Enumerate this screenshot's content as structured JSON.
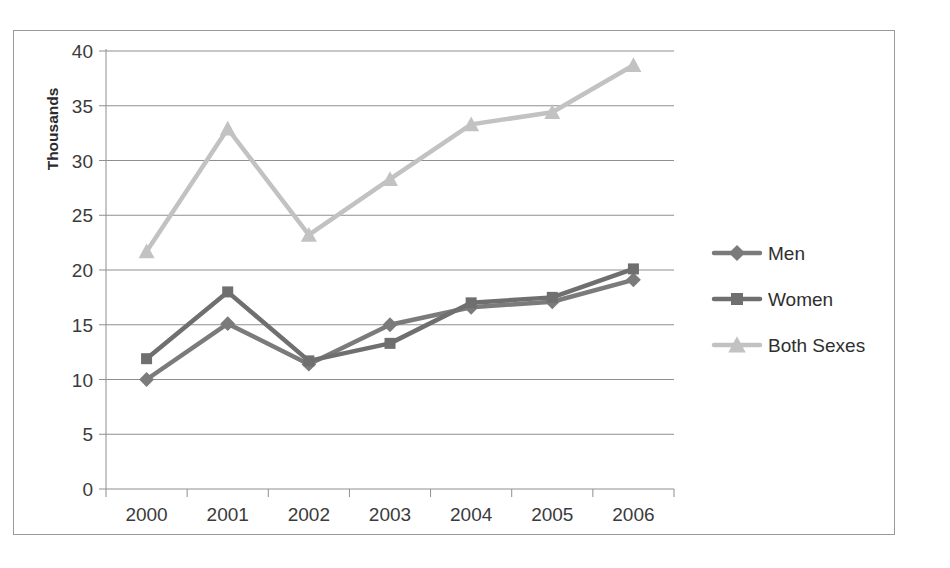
{
  "page": {
    "clipped_caption_text": ""
  },
  "chart_data": {
    "type": "line",
    "title": "",
    "xlabel": "",
    "ylabel": "Thousands",
    "categories": [
      "2000",
      "2001",
      "2002",
      "2003",
      "2004",
      "2005",
      "2006"
    ],
    "x": [
      2000,
      2001,
      2002,
      2003,
      2004,
      2005,
      2006
    ],
    "ylim": [
      0,
      40
    ],
    "yticks": [
      0,
      5,
      10,
      15,
      20,
      25,
      30,
      35,
      40
    ],
    "ytick_labels": [
      "0",
      "5",
      "10",
      "15",
      "20",
      "25",
      "30",
      "35",
      "40"
    ],
    "grid": true,
    "grid_axis": "y",
    "legend_position": "right",
    "series": [
      {
        "name": "Men",
        "marker": "diamond",
        "color": "#7b7b7b",
        "values": [
          10.0,
          15.1,
          11.4,
          15.0,
          16.6,
          17.1,
          19.1
        ]
      },
      {
        "name": "Women",
        "marker": "square",
        "color": "#6f6f6f",
        "values": [
          11.9,
          18.0,
          11.7,
          13.3,
          17.0,
          17.5,
          20.1
        ]
      },
      {
        "name": "Both Sexes",
        "marker": "triangle",
        "color": "#c2c2c2",
        "values": [
          21.7,
          32.9,
          23.2,
          28.3,
          33.3,
          34.4,
          38.7
        ]
      }
    ]
  },
  "colors": {
    "frame_border": "#9a9a9a",
    "gridline": "#8f8f8f",
    "axis_line": "#8f8f8f",
    "tick_text": "#3b3b3b",
    "axis_title_text": "#2b2b2b",
    "plot_background": "#ffffff"
  }
}
